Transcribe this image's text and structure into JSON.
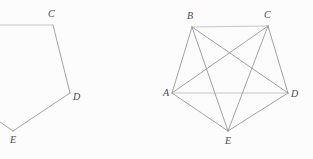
{
  "canvas": {
    "width": 313,
    "height": 159,
    "background_color": "#fcfcfc"
  },
  "style": {
    "edge_color": "#8c8c8c",
    "edge_color_light": "#b8b8b8",
    "edge_width": 0.8,
    "label_color": "#4a4a4a",
    "label_font_size": 10
  },
  "figures": [
    {
      "id": "left-figure",
      "name": "partial-pentagon",
      "description": "Pentagon outline cropped at the left edge of the canvas",
      "vertices": [
        {
          "label": "C",
          "x": 53,
          "y": 25,
          "label_x": 48,
          "label_y": 17,
          "visible": true
        },
        {
          "label": "D",
          "x": 70,
          "y": 93,
          "label_x": 73,
          "label_y": 100,
          "visible": true
        },
        {
          "label": "E",
          "x": 13,
          "y": 131,
          "label_x": 10,
          "label_y": 143,
          "visible": true
        }
      ],
      "offscreen_points": [
        {
          "name": "B-offscreen",
          "x": -22,
          "y": 25
        },
        {
          "name": "A-offscreen",
          "x": -42,
          "y": 93
        }
      ],
      "edges": [
        {
          "from": "B-offscreen",
          "to": "C",
          "shade": "light"
        },
        {
          "from": "C",
          "to": "D",
          "shade": "normal"
        },
        {
          "from": "D",
          "to": "E",
          "shade": "normal"
        },
        {
          "from": "E",
          "to": "A-offscreen",
          "shade": "normal"
        }
      ]
    },
    {
      "id": "right-figure",
      "name": "complete-graph-k5",
      "description": "Complete graph on five vertices: pentagon with all five diagonals drawn",
      "vertices": [
        {
          "label": "A",
          "x": 172,
          "y": 93,
          "label_x": 163,
          "label_y": 96,
          "visible": true
        },
        {
          "label": "B",
          "x": 192,
          "y": 27,
          "label_x": 187,
          "label_y": 19,
          "visible": true
        },
        {
          "label": "C",
          "x": 268,
          "y": 26,
          "label_x": 264,
          "label_y": 18,
          "visible": true
        },
        {
          "label": "D",
          "x": 288,
          "y": 93,
          "label_x": 291,
          "label_y": 97,
          "visible": true
        },
        {
          "label": "E",
          "x": 228,
          "y": 131,
          "label_x": 225,
          "label_y": 144,
          "visible": true
        }
      ],
      "edges": [
        {
          "from": "A",
          "to": "B",
          "shade": "normal",
          "kind": "side"
        },
        {
          "from": "B",
          "to": "C",
          "shade": "light",
          "kind": "side"
        },
        {
          "from": "C",
          "to": "D",
          "shade": "normal",
          "kind": "side"
        },
        {
          "from": "D",
          "to": "E",
          "shade": "normal",
          "kind": "side"
        },
        {
          "from": "E",
          "to": "A",
          "shade": "normal",
          "kind": "side"
        },
        {
          "from": "A",
          "to": "C",
          "shade": "normal",
          "kind": "diagonal"
        },
        {
          "from": "A",
          "to": "D",
          "shade": "light",
          "kind": "diagonal"
        },
        {
          "from": "B",
          "to": "D",
          "shade": "normal",
          "kind": "diagonal"
        },
        {
          "from": "B",
          "to": "E",
          "shade": "normal",
          "kind": "diagonal"
        },
        {
          "from": "C",
          "to": "E",
          "shade": "normal",
          "kind": "diagonal"
        }
      ],
      "vertex_count": 5,
      "edge_count": 10
    }
  ]
}
